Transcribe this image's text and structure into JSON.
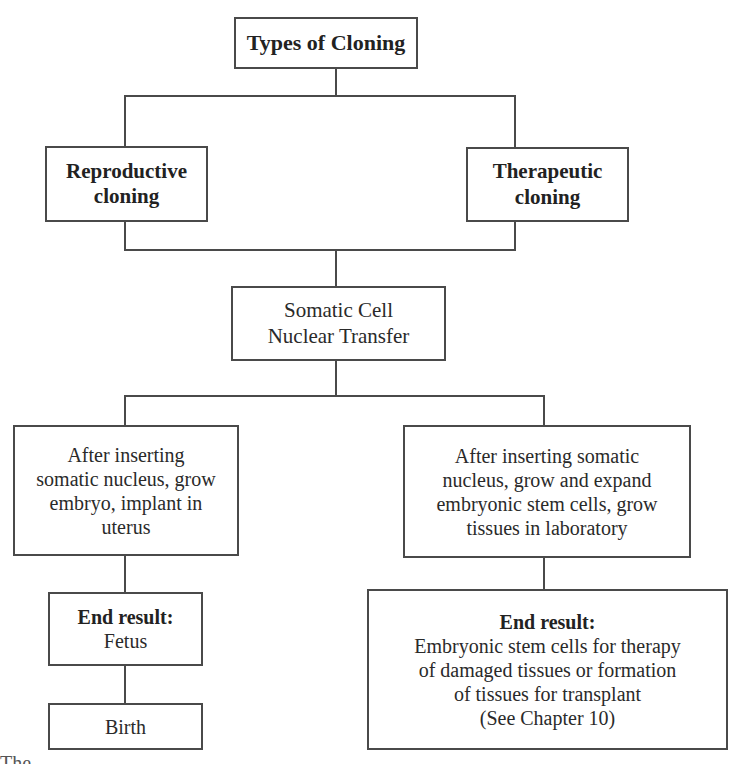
{
  "diagram": {
    "title": "Types of Cloning",
    "types": {
      "reproductive": {
        "line1": "Reproductive",
        "line2": "cloning"
      },
      "therapeutic": {
        "line1": "Therapeutic",
        "line2": "cloning"
      }
    },
    "common_step": {
      "line1": "Somatic Cell",
      "line2": "Nuclear Transfer"
    },
    "reproductive_branch": {
      "process": [
        "After inserting",
        "somatic nucleus, grow",
        "embryo, implant in",
        "uterus"
      ],
      "end_result_label": "End result:",
      "end_result_value": "Fetus",
      "final_step": "Birth"
    },
    "therapeutic_branch": {
      "process": [
        "After inserting somatic",
        "nucleus, grow and expand",
        "embryonic stem cells, grow",
        "tissues in laboratory"
      ],
      "end_result_label": "End result:",
      "end_result_lines": [
        "Embryonic stem cells for therapy",
        "of damaged tissues or formation",
        "of tissues for transplant",
        "(See Chapter 10)"
      ]
    },
    "caption_fragment": "The ..."
  }
}
